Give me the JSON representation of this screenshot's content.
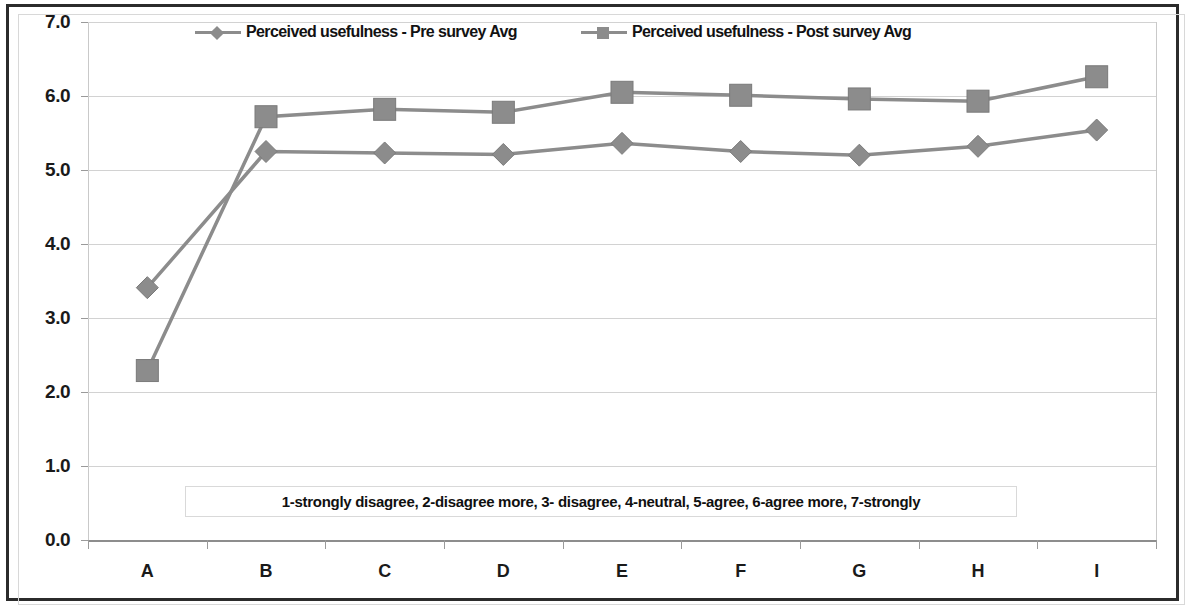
{
  "chart_data": {
    "type": "line",
    "title": "",
    "xlabel": "",
    "ylabel": "",
    "ylim": [
      0.0,
      7.0
    ],
    "ytick_labels": [
      "7.0",
      "6.0",
      "5.0",
      "4.0",
      "3.0",
      "2.0",
      "1.0",
      "0.0"
    ],
    "ytick_values": [
      7.0,
      6.0,
      5.0,
      4.0,
      3.0,
      2.0,
      1.0,
      0.0
    ],
    "grid": true,
    "legend_position": "top-inside",
    "categories": [
      "A",
      "B",
      "C",
      "D",
      "E",
      "F",
      "G",
      "H",
      "I"
    ],
    "series": [
      {
        "name": "Perceived usefulness - Pre survey Avg",
        "marker": "diamond",
        "color": "#8c8c8c",
        "values": [
          3.41,
          5.25,
          5.23,
          5.21,
          5.36,
          5.25,
          5.2,
          5.32,
          5.54
        ]
      },
      {
        "name": "Perceived usefulness - Post survey Avg",
        "marker": "square",
        "color": "#8c8c8c",
        "values": [
          2.29,
          5.72,
          5.82,
          5.78,
          6.05,
          6.01,
          5.96,
          5.93,
          6.26
        ]
      }
    ],
    "annotations": [
      "1-strongly disagree, 2-disagree more, 3- disagree, 4-neutral, 5-agree, 6-agree more, 7-strongly"
    ]
  },
  "legend": {
    "items": [
      {
        "label": "Perceived usefulness - Pre survey Avg",
        "marker": "diamond"
      },
      {
        "label": "Perceived usefulness - Post survey Avg",
        "marker": "square"
      }
    ]
  },
  "annotation": {
    "text": "1-strongly disagree, 2-disagree more, 3- disagree, 4-neutral, 5-agree, 6-agree more, 7-strongly"
  },
  "colors": {
    "series": "#8c8c8c",
    "grid": "#d2d2d2",
    "axis": "#8d8d8d",
    "frame": "#2b2b2b",
    "text": "#121212"
  }
}
